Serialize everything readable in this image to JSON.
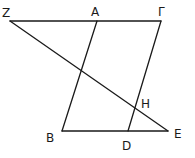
{
  "diagram": {
    "title": "",
    "points": [
      {
        "id": "Z",
        "label": "Z",
        "x": 10,
        "y": 21,
        "lx": 2,
        "ly": 17
      },
      {
        "id": "A",
        "label": "A",
        "x": 97,
        "y": 21,
        "lx": 91,
        "ly": 16
      },
      {
        "id": "G",
        "label": "Γ",
        "x": 161,
        "y": 21,
        "lx": 158,
        "ly": 16
      },
      {
        "id": "B",
        "label": "B",
        "x": 62,
        "y": 131,
        "lx": 46,
        "ly": 142
      },
      {
        "id": "D",
        "label": "D",
        "x": 128,
        "y": 131,
        "lx": 122,
        "ly": 150
      },
      {
        "id": "E",
        "label": "E",
        "x": 168,
        "y": 131,
        "lx": 174,
        "ly": 138
      },
      {
        "id": "H",
        "label": "H",
        "x": 135,
        "y": 107,
        "lx": 141,
        "ly": 108
      }
    ],
    "segments": [
      {
        "from": "Z",
        "to": "G"
      },
      {
        "from": "A",
        "to": "B"
      },
      {
        "from": "G",
        "to": "D"
      },
      {
        "from": "B",
        "to": "E"
      },
      {
        "from": "Z",
        "to": "E"
      }
    ],
    "stroke_color": "#1a1a1a",
    "background": "#ffffff"
  }
}
